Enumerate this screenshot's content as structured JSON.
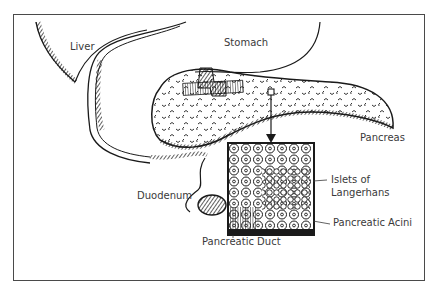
{
  "diagram": {
    "type": "anatomical-illustration",
    "labels": {
      "liver": "Liver",
      "stomach": "Stomach",
      "pancreas": "Pancreas",
      "duodenum": "Duodenum",
      "islets_line1": "Islets of",
      "islets_line2": "Langerhans",
      "acini": "Pancreatic Acini",
      "duct": "Pancreatic Duct"
    },
    "colors": {
      "ink": "#1a1a1a",
      "frame": "#4a4a4a",
      "label": "#3a3a3a",
      "background": "#ffffff"
    }
  }
}
